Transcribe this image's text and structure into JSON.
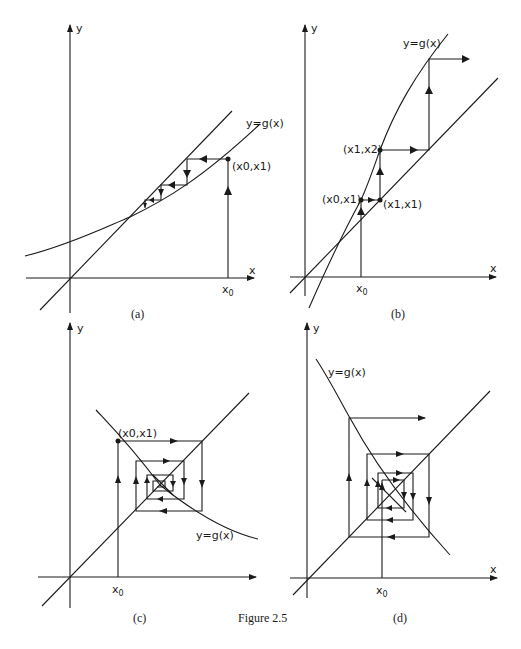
{
  "figure": {
    "caption": "Figure 2.5",
    "panels": [
      {
        "id": "a",
        "caption": "(a)",
        "axis_x_label": "x",
        "axis_y_label": "y",
        "curve_label": "y=g(x)",
        "x0_label": "x",
        "x0_sub": "0",
        "point_label": "(x0,x1)",
        "description": "Monotone convergence: cobweb staircase approaches fixed point from above"
      },
      {
        "id": "b",
        "caption": "(b)",
        "axis_x_label": "x",
        "axis_y_label": "y",
        "curve_label": "y=g(x)",
        "x0_label": "x",
        "x0_sub": "0",
        "point_labels": [
          "(x0,x1)",
          "(x1,x1)",
          "(x1,x2)"
        ],
        "description": "Monotone divergence: staircase moves away from fixed point"
      },
      {
        "id": "c",
        "caption": "(c)",
        "axis_x_label": "x",
        "axis_y_label": "y",
        "curve_label": "y=g(x)",
        "x0_label": "x",
        "x0_sub": "0",
        "point_label": "(x0,x1)",
        "description": "Oscillatory convergence: cobweb spirals inward to fixed point"
      },
      {
        "id": "d",
        "caption": "(d)",
        "axis_x_label": "x",
        "axis_y_label": "y",
        "curve_label": "y=g(x)",
        "x0_label": "x",
        "x0_sub": "0",
        "description": "Oscillatory divergence: cobweb spirals outward from fixed point"
      }
    ]
  }
}
